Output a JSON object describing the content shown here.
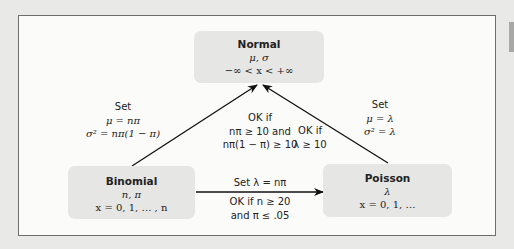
{
  "nodes": {
    "normal": {
      "title": "Normal",
      "params": "μ, σ",
      "support": "−∞ < x < +∞"
    },
    "binomial": {
      "title": "Binomial",
      "params": "n, π",
      "support": "x = 0, 1, … , n"
    },
    "poisson": {
      "title": "Poisson",
      "params": "λ",
      "support": "x = 0, 1, …"
    }
  },
  "edges": {
    "binomial_to_normal": {
      "set_label": "Set",
      "set_1": "μ = nπ",
      "set_2": "σ² = nπ(1 − π)",
      "ok_label": "OK if",
      "ok_1": "nπ ≥ 10 and",
      "ok_2": "nπ(1 − π) ≥ 10"
    },
    "poisson_to_normal": {
      "set_label": "Set",
      "set_1": "μ = λ",
      "set_2": "σ² = λ",
      "ok_label": "OK if",
      "ok_1": "λ ≥ 10"
    },
    "binomial_to_poisson": {
      "set_line": "Set  λ = nπ",
      "ok_1": "OK if  n ≥ 20",
      "ok_2": "and π ≤ .05"
    }
  },
  "colors": {
    "background": "#e9e9e7",
    "frame": "#fbfbfa",
    "node": "#e6e6e4",
    "arrow": "#111111"
  }
}
